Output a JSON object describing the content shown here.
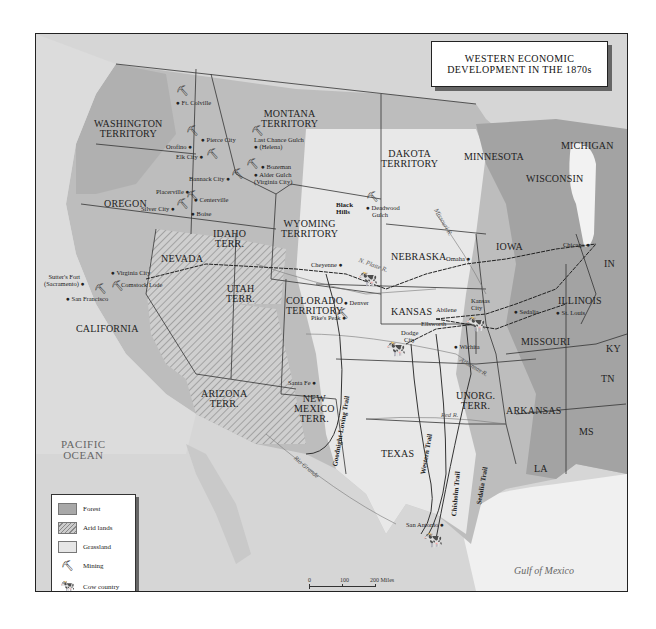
{
  "title": {
    "line1": "WESTERN ECONOMIC",
    "line2": "DEVELOPMENT IN THE 1870s"
  },
  "legend": {
    "items": [
      {
        "icon": "forest-swatch",
        "label": "Forest",
        "color": "#a8a8a8"
      },
      {
        "icon": "arid-lands-swatch",
        "label": "Arid lands",
        "color": "#c8c8c8"
      },
      {
        "icon": "grassland-swatch",
        "label": "Grassland",
        "color": "#e6e6e6"
      },
      {
        "icon": "mining-pick-icon",
        "label": "Mining"
      },
      {
        "icon": "cow-icon",
        "label": "Cow country"
      }
    ]
  },
  "scale_bar": {
    "miles": [
      "0",
      "100",
      "200 Miles"
    ],
    "kilometers": [
      "0",
      "100",
      "200 Kilometers"
    ]
  },
  "water_bodies": {
    "pacific_line1": "PACIFIC",
    "pacific_line2": "OCEAN",
    "gulf": "Gulf of Mexico"
  },
  "regions": {
    "washington": [
      "WASHINGTON",
      "TERRITORY"
    ],
    "montana": [
      "MONTANA",
      "TERRITORY"
    ],
    "oregon": "OREGON",
    "idaho": [
      "IDAHO",
      "TERR."
    ],
    "dakota": [
      "DAKOTA",
      "TERRITORY"
    ],
    "minnesota": "MINNESOTA",
    "michigan": "MICHIGAN",
    "wisconsin": "WISCONSIN",
    "wyoming": [
      "WYOMING",
      "TERRITORY"
    ],
    "nevada": "NEVADA",
    "utah": [
      "UTAH",
      "TERR."
    ],
    "nebraska": "NEBRASKA",
    "iowa": "IOWA",
    "in": "IN",
    "illinois": "ILLINOIS",
    "california": "CALIFORNIA",
    "colorado": [
      "COLORADO",
      "TERRITORY"
    ],
    "kansas": "KANSAS",
    "missouri": "MISSOURI",
    "ky": "KY",
    "tn": "TN",
    "arizona": [
      "ARIZONA",
      "TERR."
    ],
    "new_mexico": [
      "NEW",
      "MEXICO",
      "TERR."
    ],
    "unorg": [
      "UNORG.",
      "TERR."
    ],
    "arkansas": "ARKANSAS",
    "texas": "TEXAS",
    "ms": "MS",
    "la": "LA",
    "black_hills": [
      "Black",
      "Hills"
    ]
  },
  "cities": {
    "ft_colville": "Ft. Colville",
    "pierce_city": "Pierce City",
    "orofino": "Orofino",
    "elk_city": "Elk City",
    "last_chance": "Last Chance Gulch",
    "helena": "(Helena)",
    "bozeman": "Bozeman",
    "alder_gulch": "Alder Gulch",
    "virginia_city_mt": "(Virginia City)",
    "bannack_city": "Bannack City",
    "placerville": "Placerville",
    "centerville": "Centerville",
    "silver_city": "Silver City",
    "boise": "Boise",
    "deadwood": "Deadwood",
    "deadwood2": "Gulch",
    "virginia_city_nv": "Virginia City",
    "comstock": "Comstock Lode",
    "sutters_fort": "Sutter's Fort",
    "sacramento": "(Sacramento)",
    "san_francisco": "San Francisco",
    "cheyenne": "Cheyenne",
    "omaha": "Omaha",
    "chicago": "Chicago",
    "denver": "Denver",
    "pikes_peak": "Pike's Peak",
    "abilene": "Abilene",
    "kansas_city1": "Kansas",
    "kansas_city2": "City",
    "sedalia": "Sedalia",
    "st_louis": "St. Louis",
    "ellsworth": "Ellsworth",
    "dodge1": "Dodge",
    "dodge2": "City",
    "wichita": "Wichita",
    "santa_fe": "Santa Fe",
    "san_antonio": "San Antonio"
  },
  "rivers": {
    "n_platte": "N. Platte R.",
    "missouri": "Missouri R.",
    "arkansas": "Arkansas R.",
    "red": "Red R.",
    "rio_grande": "Rio Grande"
  },
  "trails": {
    "goodnight": "Goodnight-Loving Trail",
    "western": "Western Trail",
    "chisholm": "Chisholm Trail",
    "sedalia": "Sedalia Trail"
  }
}
